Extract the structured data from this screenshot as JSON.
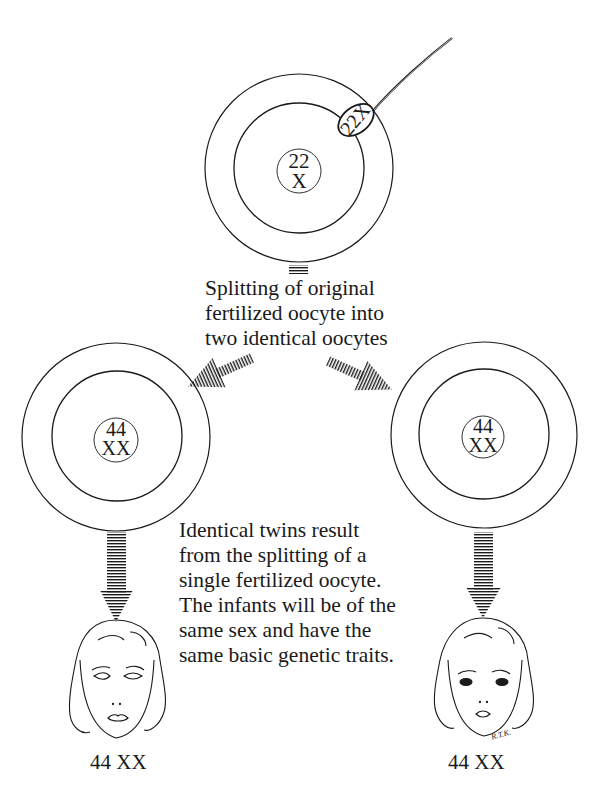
{
  "diagram": {
    "top_cell": {
      "nucleus_line1": "22",
      "nucleus_line2": "X",
      "sperm_label": "22X"
    },
    "split_caption": {
      "lines": [
        "Splitting of original",
        "fertilized oocyte into",
        "two identical oocytes"
      ]
    },
    "left_cell": {
      "nucleus_line1": "44",
      "nucleus_line2": "XX"
    },
    "right_cell": {
      "nucleus_line1": "44",
      "nucleus_line2": "XX"
    },
    "twins_caption": {
      "lines": [
        "Identical twins result",
        "from the splitting of a",
        "single fertilized oocyte.",
        "The infants will be of the",
        "same sex and have the",
        "same basic genetic traits."
      ]
    },
    "left_infant_label": "44 XX",
    "right_infant_label": "44 XX",
    "artist_signature": "R.T.K.",
    "colors": {
      "ink": "#1a1a1a",
      "background": "#ffffff"
    }
  }
}
